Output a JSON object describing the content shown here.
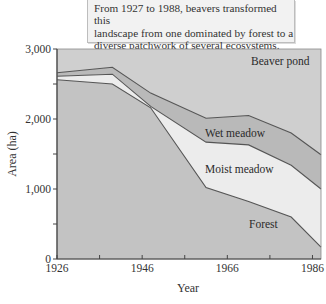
{
  "caption": {
    "line1": "From 1927 to 1988, beavers transformed this",
    "line2": "landscape from one dominated by forest to a",
    "line3": "diverse patchwork of several ecosystems."
  },
  "colors": {
    "beaver_pond": "#cfcfcf",
    "wet_meadow": "#b9b9b9",
    "moist_meadow": "#ececec",
    "forest": "#c3c3c3",
    "line": "#555555",
    "axis": "#444444"
  },
  "chart_data": {
    "type": "area",
    "stacked": true,
    "title": "",
    "xlabel": "Year",
    "ylabel": "Area (ha)",
    "xlim": [
      1926,
      1988
    ],
    "ylim": [
      0,
      3000
    ],
    "x_ticks": [
      1926,
      1936,
      1946,
      1956,
      1966,
      1976,
      1986
    ],
    "x_tick_labels": [
      "1926",
      "",
      "1946",
      "",
      "1966",
      "",
      "1986"
    ],
    "y_ticks": [
      0,
      500,
      1000,
      1500,
      2000,
      2500,
      3000
    ],
    "y_tick_labels": [
      "0",
      "",
      "1,000",
      "",
      "2,000",
      "",
      "3,000"
    ],
    "grid": false,
    "legend": "inline area labels",
    "x": [
      1926,
      1939,
      1948,
      1961,
      1971,
      1981,
      1988
    ],
    "boundaries": [
      {
        "name": "Forest (upper edge)",
        "values": [
          2560,
          2500,
          2160,
          1020,
          820,
          600,
          170
        ]
      },
      {
        "name": "Moist meadow (upper edge)",
        "values": [
          2610,
          2640,
          2180,
          1670,
          1630,
          1340,
          1000
        ]
      },
      {
        "name": "Wet meadow (upper edge)",
        "values": [
          2660,
          2740,
          2370,
          2010,
          2050,
          1800,
          1490
        ]
      },
      {
        "name": "Beaver pond (upper edge)",
        "values": [
          3000,
          3000,
          3000,
          3000,
          3000,
          3000,
          3000
        ]
      }
    ],
    "series": [
      {
        "name": "Forest",
        "values": [
          2560,
          2500,
          2160,
          1020,
          820,
          600,
          170
        ]
      },
      {
        "name": "Moist meadow",
        "values": [
          50,
          140,
          20,
          650,
          810,
          740,
          830
        ]
      },
      {
        "name": "Wet meadow",
        "values": [
          50,
          100,
          190,
          340,
          420,
          460,
          490
        ]
      },
      {
        "name": "Beaver pond",
        "values": [
          340,
          260,
          630,
          990,
          950,
          1200,
          1510
        ]
      }
    ],
    "labels": {
      "beaver_pond": "Beaver pond",
      "wet_meadow": "Wet meadow",
      "moist_meadow": "Moist meadow",
      "forest": "Forest"
    }
  }
}
